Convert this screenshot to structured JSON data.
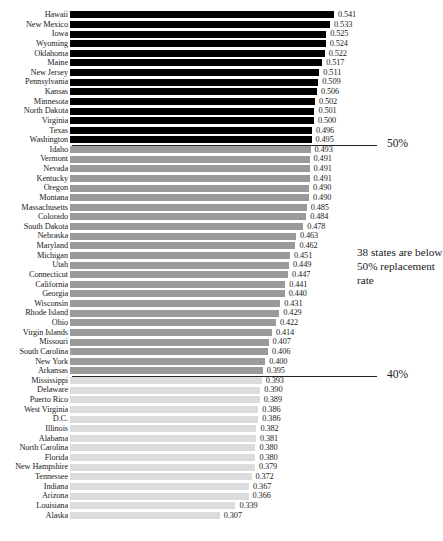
{
  "chart_data": {
    "type": "bar",
    "orientation": "horizontal",
    "title": "",
    "subtitle": "",
    "xlabel": "",
    "ylabel": "",
    "xlim": [
      0,
      0.58
    ],
    "grid": false,
    "legend": null,
    "value_format": "0.000",
    "categories": [
      "Hawaii",
      "New Mexico",
      "Iowa",
      "Wyoming",
      "Oklahoma",
      "Maine",
      "New Jersey",
      "Pennsylvania",
      "Kansas",
      "Minnesota",
      "North Dakota",
      "Virginia",
      "Texas",
      "Washington",
      "Idaho",
      "Vermont",
      "Nevada",
      "Kentucky",
      "Oregon",
      "Montana",
      "Massachusetts",
      "Colorado",
      "South Dakota",
      "Nebraska",
      "Maryland",
      "Michigan",
      "Utah",
      "Connecticut",
      "California",
      "Georgia",
      "Wisconsin",
      "Rhode Island",
      "Ohio",
      "Virgin Islands",
      "Missouri",
      "South Carolina",
      "New York",
      "Arkansas",
      "Mississippi",
      "Delaware",
      "Puerto Rico",
      "West Virginia",
      "D.C.",
      "Illinois",
      "Alabama",
      "North Carolina",
      "Florida",
      "New Hampshire",
      "Tennessee",
      "Indiana",
      "Arizona",
      "Louisiana",
      "Alaska"
    ],
    "values": [
      0.541,
      0.533,
      0.525,
      0.524,
      0.522,
      0.517,
      0.511,
      0.509,
      0.506,
      0.502,
      0.501,
      0.5,
      0.496,
      0.495,
      0.493,
      0.491,
      0.491,
      0.491,
      0.49,
      0.49,
      0.485,
      0.484,
      0.478,
      0.463,
      0.462,
      0.451,
      0.449,
      0.447,
      0.441,
      0.44,
      0.431,
      0.429,
      0.422,
      0.414,
      0.407,
      0.406,
      0.4,
      0.395,
      0.393,
      0.39,
      0.389,
      0.386,
      0.386,
      0.382,
      0.381,
      0.38,
      0.38,
      0.379,
      0.372,
      0.367,
      0.366,
      0.339,
      0.307
    ],
    "value_labels": [
      "0.541",
      "0.533",
      "0.525",
      "0.524",
      "0.522",
      "0.517",
      "0.511",
      "0.509",
      "0.506",
      "0.502",
      "0.501",
      "0.500",
      "0.496",
      "0.495",
      "0.493",
      "0.491",
      "0.491",
      "0.491",
      "0.490",
      "0.490",
      "0.485",
      "0.484",
      "0.478",
      "0.463",
      "0.462",
      "0.451",
      "0.449",
      "0.447",
      "0.441",
      "0.440",
      "0.431",
      "0.429",
      "0.422",
      "0.414",
      "0.407",
      "0.406",
      "0.400",
      "0.395",
      "0.393",
      "0.390",
      "0.389",
      "0.386",
      "0.386",
      "0.382",
      "0.381",
      "0.380",
      "0.380",
      "0.379",
      "0.372",
      "0.367",
      "0.366",
      "0.339",
      "0.307"
    ],
    "bar_colors": [
      "#000000",
      "#000000",
      "#000000",
      "#000000",
      "#000000",
      "#000000",
      "#000000",
      "#000000",
      "#000000",
      "#000000",
      "#000000",
      "#000000",
      "#000000",
      "#000000",
      "#9a9a9a",
      "#9a9a9a",
      "#9a9a9a",
      "#9a9a9a",
      "#9a9a9a",
      "#9a9a9a",
      "#9a9a9a",
      "#9a9a9a",
      "#9a9a9a",
      "#9a9a9a",
      "#9a9a9a",
      "#9a9a9a",
      "#9a9a9a",
      "#9a9a9a",
      "#9a9a9a",
      "#9a9a9a",
      "#9a9a9a",
      "#9a9a9a",
      "#9a9a9a",
      "#9a9a9a",
      "#9a9a9a",
      "#9a9a9a",
      "#9a9a9a",
      "#9a9a9a",
      "#dcdcdc",
      "#dcdcdc",
      "#dcdcdc",
      "#dcdcdc",
      "#dcdcdc",
      "#dcdcdc",
      "#dcdcdc",
      "#dcdcdc",
      "#dcdcdc",
      "#dcdcdc",
      "#dcdcdc",
      "#dcdcdc",
      "#dcdcdc",
      "#dcdcdc",
      "#dcdcdc"
    ],
    "reference_lines": [
      {
        "label": "50%",
        "value": 0.5,
        "after_category": "Washington"
      },
      {
        "label": "40%",
        "value": 0.4,
        "after_category": "Arkansas"
      }
    ],
    "annotations": [
      {
        "text": "38 states are below 50% replacement rate"
      }
    ]
  },
  "colors": {
    "bar_high": "#000000",
    "bar_mid": "#9a9a9a",
    "bar_low": "#dcdcdc",
    "text": "#1b1b1b",
    "rule": "#232323",
    "background": "#ffffff"
  }
}
